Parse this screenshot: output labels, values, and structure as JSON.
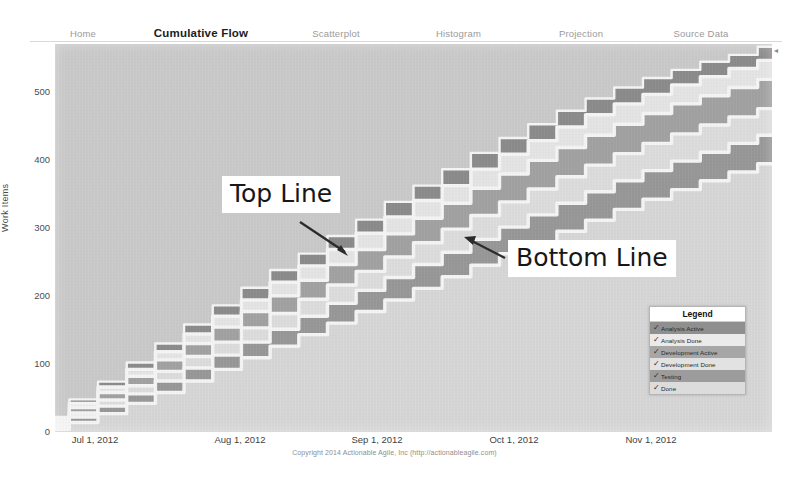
{
  "tabs": [
    {
      "label": "Home",
      "active": false
    },
    {
      "label": "Cumulative Flow",
      "active": true
    },
    {
      "label": "Scatterplot",
      "active": false
    },
    {
      "label": "Histogram",
      "active": false
    },
    {
      "label": "Projection",
      "active": false
    },
    {
      "label": "Source Data",
      "active": false
    }
  ],
  "tabbar": {
    "scroll_right_icon": "chevron-right-icon",
    "scroll_right_glyph": "◂"
  },
  "annotations": [
    {
      "text": "Top Line",
      "name": "annotation-top-line"
    },
    {
      "text": "Bottom Line",
      "name": "annotation-bottom-line"
    }
  ],
  "legend": {
    "title": "Legend",
    "check_glyph": "✓",
    "items": [
      {
        "label": "Analysis Active",
        "color": "#8f8f8f",
        "checked": true
      },
      {
        "label": "Analysis Done",
        "color": "#eaeaea",
        "checked": true
      },
      {
        "label": "Development Active",
        "color": "#a6a6a6",
        "checked": true
      },
      {
        "label": "Development Done",
        "color": "#e2e2e2",
        "checked": true
      },
      {
        "label": "Testing",
        "color": "#9c9c9c",
        "checked": true
      },
      {
        "label": "Done",
        "color": "#dcdcdc",
        "checked": true
      }
    ]
  },
  "footer": {
    "copyright": "Copyright 2014 Actionable Agile, Inc (http://actionableagile.com)"
  },
  "chart_data": {
    "type": "area",
    "title": "Cumulative Flow",
    "xlabel": "",
    "ylabel": "Work Items",
    "xlim": [
      "Jun 20, 2012",
      "Nov 17, 2012"
    ],
    "ylim": [
      0,
      570
    ],
    "yticks": [
      0,
      100,
      200,
      300,
      400,
      500
    ],
    "xticks": [
      "Jul 1, 2012",
      "Aug 1, 2012",
      "Sep 1, 2012",
      "Oct 1, 2012",
      "Nov 1, 2012"
    ],
    "grid": false,
    "legend_position": "bottom-right",
    "stacked": true,
    "x": [
      0,
      4,
      8,
      12,
      16,
      20,
      24,
      28,
      32,
      36,
      40,
      44,
      48,
      52,
      56,
      60,
      64,
      68,
      72,
      76,
      80,
      84,
      88,
      92,
      96,
      100
    ],
    "series": [
      {
        "name": "Analysis Active",
        "color": "#8f8f8f",
        "cumulative_top": [
          22,
          48,
          74,
          102,
          130,
          158,
          186,
          212,
          238,
          262,
          288,
          312,
          338,
          362,
          386,
          410,
          432,
          452,
          472,
          490,
          506,
          520,
          532,
          544,
          554,
          566
        ]
      },
      {
        "name": "Analysis Done",
        "color": "#eaeaea",
        "cumulative_top": [
          18,
          42,
          66,
          92,
          118,
          144,
          170,
          194,
          220,
          244,
          268,
          292,
          316,
          340,
          362,
          386,
          408,
          428,
          448,
          466,
          482,
          496,
          510,
          522,
          534,
          546
        ]
      },
      {
        "name": "Development Active",
        "color": "#a6a6a6",
        "cumulative_top": [
          15,
          36,
          58,
          82,
          106,
          130,
          154,
          177,
          200,
          223,
          246,
          268,
          291,
          314,
          336,
          358,
          379,
          399,
          418,
          436,
          452,
          468,
          482,
          494,
          506,
          518
        ]
      },
      {
        "name": "Development Done",
        "color": "#e2e2e2",
        "cumulative_top": [
          11,
          28,
          47,
          68,
          89,
          111,
          132,
          153,
          174,
          195,
          216,
          236,
          257,
          278,
          298,
          318,
          338,
          357,
          375,
          392,
          409,
          424,
          438,
          451,
          463,
          475
        ]
      },
      {
        "name": "Testing",
        "color": "#9c9c9c",
        "cumulative_top": [
          8,
          22,
          38,
          56,
          75,
          94,
          113,
          132,
          151,
          170,
          189,
          208,
          227,
          246,
          264,
          283,
          301,
          319,
          336,
          353,
          369,
          384,
          398,
          411,
          424,
          436
        ]
      },
      {
        "name": "Done",
        "color": "#dcdcdc",
        "cumulative_top": [
          4,
          14,
          27,
          42,
          58,
          75,
          92,
          109,
          126,
          143,
          160,
          177,
          194,
          211,
          228,
          245,
          262,
          279,
          295,
          311,
          327,
          342,
          356,
          369,
          382,
          394
        ]
      }
    ]
  }
}
